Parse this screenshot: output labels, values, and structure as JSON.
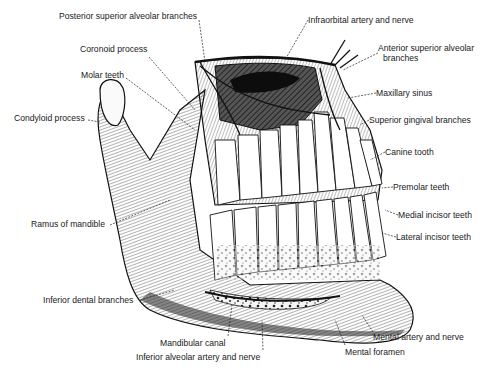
{
  "diagram": {
    "labels": [
      {
        "id": "posterior-superior-alveolar-branches",
        "text": "Posterior superior alveolar branches",
        "x": 59,
        "y": 11
      },
      {
        "id": "coronoid-process",
        "text": "Coronoid process",
        "x": 80,
        "y": 44
      },
      {
        "id": "molar-teeth",
        "text": "Molar teeth",
        "x": 81,
        "y": 70
      },
      {
        "id": "condyloid-process",
        "text": "Condyloid process",
        "x": 14,
        "y": 113
      },
      {
        "id": "ramus-of-mandible",
        "text": "Ramus of mandible",
        "x": 31,
        "y": 219
      },
      {
        "id": "inferior-dental-branches",
        "text": "Inferior dental branches",
        "x": 43,
        "y": 295
      },
      {
        "id": "mandibular-canal",
        "text": "Mandibular canal",
        "x": 160,
        "y": 338
      },
      {
        "id": "inferior-alveolar-artery-and-nerve",
        "text": "Inferior alveolar artery and nerve",
        "x": 136,
        "y": 352
      },
      {
        "id": "mental-foramen",
        "text": "Mental foramen",
        "x": 345,
        "y": 347
      },
      {
        "id": "mental-artery-and-nerve",
        "text": "Mental artery and nerve",
        "x": 373,
        "y": 332
      },
      {
        "id": "infraorbital-artery-and-nerve",
        "text": "Infraorbital artery and nerve",
        "x": 308,
        "y": 15
      },
      {
        "id": "anterior-superior-alveolar-branches",
        "text": "Anterior superior alveolar",
        "text2": "branches",
        "x": 378,
        "y": 43
      },
      {
        "id": "maxillary-sinus",
        "text": "Maxillary sinus",
        "x": 376,
        "y": 88
      },
      {
        "id": "superior-gingival-branches",
        "text": "Superior gingival branches",
        "x": 369,
        "y": 115
      },
      {
        "id": "canine-tooth",
        "text": "Canine tooth",
        "x": 385,
        "y": 147
      },
      {
        "id": "premolar-teeth",
        "text": "Premolar teeth",
        "x": 393,
        "y": 182
      },
      {
        "id": "medial-incisor-teeth",
        "text": "Medial incisor teeth",
        "x": 398,
        "y": 210
      },
      {
        "id": "lateral-incisor-teeth",
        "text": "Lateral incisor teeth",
        "x": 396,
        "y": 232
      }
    ]
  }
}
